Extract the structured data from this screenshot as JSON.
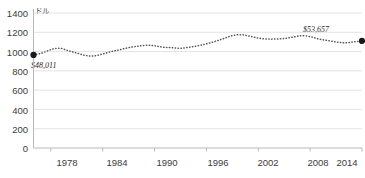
{
  "chart_data": {
    "type": "line",
    "title": "",
    "subtitle": "",
    "xlabel": "",
    "ylabel": "ドル",
    "ylim": [
      0,
      1400
    ],
    "xlim": [
      1976,
      2014
    ],
    "grid": true,
    "legend": "none",
    "y_ticks": [
      1400,
      1200,
      1000,
      800,
      600,
      400,
      200,
      0
    ],
    "x_ticks": [
      1978,
      1984,
      1990,
      1996,
      2002,
      2008,
      2014
    ],
    "line_style": "dotted",
    "series": [
      {
        "name": "ドル",
        "color": "#555555",
        "x": [
          1976,
          1977,
          1978,
          1979,
          1980,
          1981,
          1982,
          1983,
          1984,
          1985,
          1986,
          1987,
          1988,
          1989,
          1990,
          1991,
          1992,
          1993,
          1994,
          1995,
          1996,
          1997,
          1998,
          1999,
          2000,
          2001,
          2002,
          2003,
          2004,
          2005,
          2006,
          2007,
          2008,
          2009,
          2010,
          2011,
          2012,
          2013,
          2014
        ],
        "values": [
          965,
          985,
          1020,
          1035,
          1010,
          985,
          960,
          955,
          975,
          1000,
          1020,
          1040,
          1055,
          1065,
          1060,
          1045,
          1040,
          1035,
          1045,
          1060,
          1080,
          1105,
          1135,
          1165,
          1175,
          1160,
          1140,
          1130,
          1130,
          1135,
          1150,
          1165,
          1155,
          1130,
          1115,
          1100,
          1090,
          1100,
          1110
        ]
      }
    ],
    "markers": [
      {
        "name": "start-marker",
        "x": 1976,
        "y": 965
      },
      {
        "name": "end-marker",
        "x": 2014,
        "y": 1110
      }
    ],
    "annotations": [
      {
        "name": "annot-start",
        "text": "$48,011"
      },
      {
        "name": "annot-end",
        "text": "$53,657"
      }
    ],
    "colors": {
      "line": "#555555",
      "marker": "#1a1a1a",
      "grid": "#dcdcdc",
      "axis": "#b8b8b8",
      "text": "#3b3b3b"
    }
  },
  "y_tick_labels": [
    "1400",
    "1200",
    "1000",
    "800",
    "600",
    "400",
    "200",
    "0"
  ],
  "x_tick_labels": [
    "1978",
    "1984",
    "1990",
    "1996",
    "2002",
    "2008",
    "2014"
  ],
  "axis_unit_label": "ドル",
  "annotation_start": "$48,011",
  "annotation_end": "$53,657"
}
